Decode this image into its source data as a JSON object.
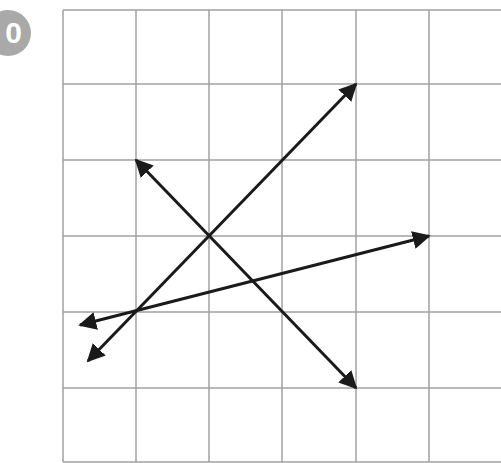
{
  "badge": {
    "label": "0",
    "color": "#a9a9a9"
  },
  "grid": {
    "columns_x": [
      63,
      136,
      209,
      282,
      356,
      429,
      502
    ],
    "rows_y": [
      10,
      84,
      160,
      236,
      312,
      388,
      462
    ],
    "line_color": "#a0a0a0"
  },
  "arrows": [
    {
      "name": "arrow-a",
      "from": [
        88,
        361
      ],
      "to": [
        356,
        84
      ],
      "double_headed": true
    },
    {
      "name": "arrow-b",
      "from": [
        136,
        160
      ],
      "to": [
        356,
        388
      ],
      "double_headed": true
    },
    {
      "name": "arrow-c",
      "from": [
        80,
        325
      ],
      "to": [
        429,
        236
      ],
      "double_headed": true
    }
  ],
  "arrow_color": "#1a1a1a"
}
